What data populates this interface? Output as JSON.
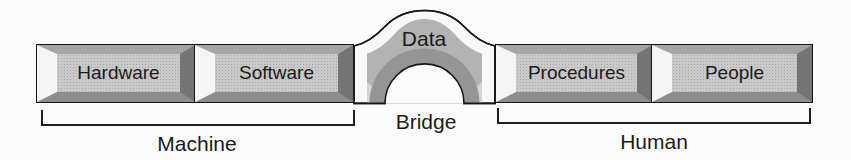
{
  "figure": {
    "background": "#fcfcfc",
    "outline_color": "#161616",
    "blocks": [
      {
        "id": "hardware",
        "label": "Hardware"
      },
      {
        "id": "software",
        "label": "Software"
      },
      {
        "id": "procedures",
        "label": "Procedures"
      },
      {
        "id": "people",
        "label": "People"
      }
    ],
    "arch": {
      "label": "Data",
      "band_light": "#f8f8f8",
      "band_mid": "#b3b3b3",
      "band_dark": "#959595",
      "bevel_highlight": "#d4d4d4",
      "hole_fill": "#fcfcfc"
    },
    "groups": [
      {
        "id": "machine",
        "label": "Machine"
      },
      {
        "id": "bridge",
        "label": "Bridge"
      },
      {
        "id": "human",
        "label": "Human"
      }
    ],
    "block_colors": {
      "face": "#c9c9c9",
      "bevel_left": "#f5f5f5",
      "bevel_top": "#a5a5a5",
      "bevel_right": "#747474",
      "bevel_bottom": "#8d8d8d"
    }
  }
}
